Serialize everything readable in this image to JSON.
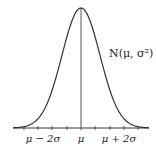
{
  "diagram": {
    "distribution_label": "N(μ, σ²)",
    "axis_labels": [
      {
        "text": "μ − 2σ",
        "x": 43
      },
      {
        "text": "μ",
        "x": 81
      },
      {
        "text": "μ + 2σ",
        "x": 119
      }
    ],
    "colors": {
      "curve": "#333333",
      "axis": "#333333",
      "center_line": "#555555",
      "background": "#ffffff"
    }
  },
  "chart_data": {
    "type": "line",
    "title": "N(μ, σ²)",
    "xlabel": "",
    "ylabel": "",
    "x_tick_labels": [
      "μ − 2σ",
      "μ",
      "μ + 2σ"
    ],
    "series": [
      {
        "name": "Normal density N(μ, σ²)",
        "x_in_sigma": [
          -3,
          -2.5,
          -2,
          -1.5,
          -1,
          -0.5,
          0,
          0.5,
          1,
          1.5,
          2,
          2.5,
          3
        ],
        "y_relative": [
          0.011,
          0.044,
          0.135,
          0.325,
          0.607,
          0.882,
          1.0,
          0.882,
          0.607,
          0.325,
          0.135,
          0.044,
          0.011
        ]
      }
    ],
    "annotations": [
      "vertical line at μ"
    ],
    "grid": false
  }
}
